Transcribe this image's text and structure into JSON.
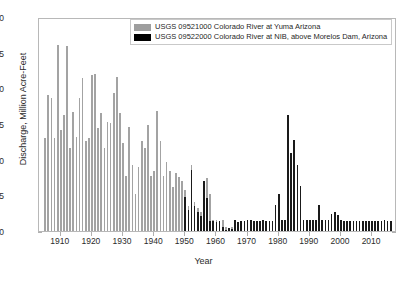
{
  "chart_data": {
    "type": "bar",
    "title": "",
    "xlabel": "Year",
    "ylabel": "Discharge, Million Acre-Feet",
    "xlim": [
      1903,
      2018
    ],
    "ylim": [
      0,
      30
    ],
    "yticks": [
      0,
      5,
      10,
      15,
      20,
      25,
      30
    ],
    "xticks": [
      1910,
      1920,
      1930,
      1940,
      1950,
      1960,
      1970,
      1980,
      1990,
      2000,
      2010
    ],
    "grid": false,
    "legend_position": "top-center",
    "colors": {
      "series_yuma": "#a3a3a3",
      "series_nib": "#1a1a1a",
      "axis": "#b8b8b8",
      "text": "#2b2b2b"
    },
    "series": [
      {
        "name": "USGS 09521000 Colorado River at Yuma Arizona",
        "color": "#a3a3a3",
        "x": [
          1905,
          1906,
          1907,
          1908,
          1909,
          1910,
          1911,
          1912,
          1913,
          1914,
          1915,
          1916,
          1917,
          1918,
          1919,
          1920,
          1921,
          1922,
          1923,
          1924,
          1925,
          1926,
          1927,
          1928,
          1929,
          1930,
          1931,
          1932,
          1933,
          1934,
          1935,
          1936,
          1937,
          1938,
          1939,
          1940,
          1941,
          1942,
          1943,
          1944,
          1945,
          1946,
          1947,
          1948,
          1949,
          1950,
          1951,
          1952,
          1953,
          1954,
          1955,
          1956,
          1957,
          1958,
          1959,
          1960,
          1961,
          1962,
          1963,
          1964,
          1965,
          1966
        ],
        "values": [
          13.0,
          19.1,
          18.6,
          13.0,
          26.1,
          14.1,
          16.2,
          25.9,
          11.6,
          16.7,
          13.2,
          18.6,
          21.5,
          12.6,
          13.0,
          21.9,
          22.0,
          14.4,
          16.6,
          11.6,
          15.3,
          15.1,
          19.3,
          21.6,
          16.5,
          12.3,
          7.7,
          14.6,
          9.3,
          5.2,
          9.0,
          12.6,
          11.6,
          14.9,
          7.7,
          8.4,
          16.8,
          12.6,
          7.7,
          9.7,
          8.4,
          6.2,
          8.2,
          7.6,
          7.0,
          5.7,
          3.5,
          9.3,
          4.0,
          3.2,
          2.6,
          2.3,
          7.5,
          5.2,
          1.6,
          1.5,
          1.3,
          1.5,
          0.6,
          0.3,
          0.5,
          0.4
        ]
      },
      {
        "name": "USGS 09522000 Colorado River at NIB, above Morelos Dam, Arizona",
        "color": "#1a1a1a",
        "x": [
          1950,
          1951,
          1952,
          1953,
          1954,
          1955,
          1956,
          1957,
          1958,
          1959,
          1960,
          1961,
          1962,
          1963,
          1964,
          1965,
          1966,
          1967,
          1968,
          1969,
          1970,
          1971,
          1972,
          1973,
          1974,
          1975,
          1976,
          1977,
          1978,
          1979,
          1980,
          1981,
          1982,
          1983,
          1984,
          1985,
          1986,
          1987,
          1988,
          1989,
          1990,
          1991,
          1992,
          1993,
          1994,
          1995,
          1996,
          1997,
          1998,
          1999,
          2000,
          2001,
          2002,
          2003,
          2004,
          2005,
          2006,
          2007,
          2008,
          2009,
          2010,
          2011,
          2012,
          2013,
          2014,
          2015,
          2016
        ],
        "values": [
          4.8,
          3.0,
          8.6,
          3.5,
          2.7,
          2.1,
          7.0,
          4.6,
          1.4,
          1.4,
          1.2,
          1.4,
          0.5,
          0.2,
          0.4,
          0.3,
          1.5,
          1.3,
          1.4,
          1.4,
          1.5,
          1.5,
          1.4,
          1.4,
          1.4,
          1.5,
          1.4,
          1.4,
          1.4,
          3.6,
          5.2,
          1.5,
          1.5,
          16.3,
          11.0,
          12.8,
          9.2,
          6.3,
          1.6,
          1.5,
          1.5,
          1.5,
          1.5,
          3.6,
          1.6,
          1.5,
          1.5,
          2.4,
          2.7,
          2.2,
          1.5,
          1.4,
          1.4,
          1.4,
          1.4,
          1.4,
          1.4,
          1.4,
          1.4,
          1.4,
          1.4,
          1.4,
          1.4,
          1.4,
          1.5,
          1.4,
          1.4
        ]
      }
    ]
  },
  "legend": {
    "items": [
      {
        "label": "USGS 09521000 Colorado River at Yuma Arizona",
        "swatch": "gray-swatch"
      },
      {
        "label": "USGS 09522000 Colorado River at NIB, above Morelos Dam, Arizona",
        "swatch": "black-swatch"
      }
    ]
  },
  "axes": {
    "xlabel": "Year",
    "ylabel": "Discharge, Million Acre-Feet",
    "ytick_labels": [
      "0",
      "5",
      "10",
      "15",
      "20",
      "25",
      "30"
    ],
    "xtick_labels": [
      "1910",
      "1920",
      "1930",
      "1940",
      "1950",
      "1960",
      "1970",
      "1980",
      "1990",
      "2000",
      "2010"
    ]
  }
}
